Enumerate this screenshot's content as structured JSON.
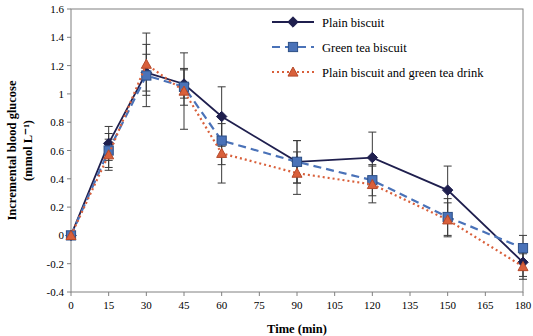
{
  "chart_data": {
    "type": "line",
    "title": "",
    "xlabel": "Time (min)",
    "ylabel_line1": "Incremental blood glucose",
    "ylabel_line2": "(mmol L⁻¹)",
    "x": [
      0,
      15,
      30,
      45,
      60,
      90,
      120,
      150,
      180
    ],
    "xticks": [
      "0",
      "15",
      "30",
      "45",
      "60",
      "75",
      "90",
      "105",
      "120",
      "135",
      "150",
      "165",
      "180"
    ],
    "xtick_values": [
      0,
      15,
      30,
      45,
      60,
      75,
      90,
      105,
      120,
      135,
      150,
      165,
      180
    ],
    "xlim": [
      0,
      180
    ],
    "yticks": [
      "-0.4",
      "-0.2",
      "0",
      "0.2",
      "0.4",
      "0.6",
      "0.8",
      "1",
      "1.2",
      "1.4",
      "1.6"
    ],
    "ytick_values": [
      -0.4,
      -0.2,
      0,
      0.2,
      0.4,
      0.6,
      0.8,
      1.0,
      1.2,
      1.4,
      1.6
    ],
    "ylim": [
      -0.4,
      1.6
    ],
    "grid": false,
    "legend_position": "top-right",
    "series": [
      {
        "name": "Plain biscuit",
        "color": "#1f1f4e",
        "marker": "diamond",
        "dash": "solid",
        "values": [
          0.0,
          0.65,
          1.15,
          1.07,
          0.84,
          0.52,
          0.55,
          0.32,
          -0.19
        ],
        "err": [
          0.0,
          0.12,
          0.13,
          0.1,
          0.21,
          0.15,
          0.18,
          0.17,
          0.1
        ]
      },
      {
        "name": "Green tea biscuit",
        "color": "#4a72b8",
        "marker": "square",
        "dash": "dashed",
        "values": [
          0.0,
          0.6,
          1.13,
          1.05,
          0.67,
          0.52,
          0.39,
          0.13,
          -0.09
        ],
        "err": [
          0.0,
          0.12,
          0.22,
          0.13,
          0.17,
          0.15,
          0.11,
          0.13,
          0.09
        ]
      },
      {
        "name": "Plain biscuit and green tea drink",
        "color": "#d9603b",
        "marker": "triangle",
        "dash": "dotted",
        "values": [
          0.0,
          0.57,
          1.21,
          1.02,
          0.58,
          0.44,
          0.36,
          0.11,
          -0.22
        ],
        "err": [
          0.0,
          0.11,
          0.22,
          0.27,
          0.21,
          0.15,
          0.13,
          0.12,
          0.09
        ]
      }
    ]
  }
}
